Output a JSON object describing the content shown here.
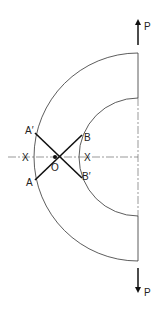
{
  "diagram": {
    "labels": {
      "A_prime": "A′",
      "A": "A",
      "B": "B",
      "B_prime": "B′",
      "O": "O",
      "X_left": "X",
      "X_right": "X",
      "P_top": "P",
      "P_bottom": "P"
    },
    "colors": {
      "line": "#333333",
      "bold": "#111111"
    }
  }
}
